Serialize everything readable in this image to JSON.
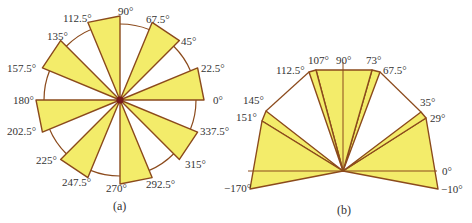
{
  "colors": {
    "fill": "#f3ec6a",
    "stroke": "#8b4a1c",
    "circle": "#8b4a1c",
    "center_dot": "#7a1a1a",
    "text": "#333333"
  },
  "figure_a": {
    "caption": "(a)",
    "center": [
      120,
      100
    ],
    "petal_radius": 84,
    "circle_radius": 76,
    "petals": [
      {
        "from": 0,
        "to": 22.5
      },
      {
        "from": 45,
        "to": 67.5
      },
      {
        "from": 90,
        "to": 112.5
      },
      {
        "from": 135,
        "to": 157.5
      },
      {
        "from": 180,
        "to": 202.5
      },
      {
        "from": 225,
        "to": 247.5
      },
      {
        "from": 270,
        "to": 292.5
      },
      {
        "from": 315,
        "to": 337.5
      }
    ],
    "labels": [
      {
        "text": "0°",
        "x": 213,
        "y": 104
      },
      {
        "text": "22.5°",
        "x": 201,
        "y": 72
      },
      {
        "text": "45°",
        "x": 181,
        "y": 45
      },
      {
        "text": "67.5°",
        "x": 146,
        "y": 23
      },
      {
        "text": "90°",
        "x": 118,
        "y": 15
      },
      {
        "text": "112.5°",
        "x": 63,
        "y": 22
      },
      {
        "text": "135°",
        "x": 47,
        "y": 40
      },
      {
        "text": "157.5°",
        "x": 7,
        "y": 72
      },
      {
        "text": "180°",
        "x": 13,
        "y": 104
      },
      {
        "text": "202.5°",
        "x": 7,
        "y": 135
      },
      {
        "text": "225°",
        "x": 36,
        "y": 164
      },
      {
        "text": "247.5°",
        "x": 62,
        "y": 186
      },
      {
        "text": "270°",
        "x": 106,
        "y": 192
      },
      {
        "text": "292.5°",
        "x": 146,
        "y": 188
      },
      {
        "text": "315°",
        "x": 185,
        "y": 168
      },
      {
        "text": "337.5°",
        "x": 200,
        "y": 135
      }
    ]
  },
  "figure_b": {
    "caption": "(b)",
    "center": [
      343,
      171
    ],
    "wedges": [
      {
        "name": "wedge-right-low",
        "points": [
          [
            343,
            171
          ],
          [
            438,
            189
          ],
          [
            426,
            118
          ]
        ]
      },
      {
        "name": "wedge-right-high",
        "points": [
          [
            343,
            171
          ],
          [
            421,
            112
          ],
          [
            426,
            118
          ]
        ]
      },
      {
        "name": "wedge-top-right",
        "points": [
          [
            343,
            171
          ],
          [
            380,
            72
          ],
          [
            372,
            70
          ]
        ]
      },
      {
        "name": "wedge-top-center",
        "points": [
          [
            343,
            171
          ],
          [
            316,
            70
          ],
          [
            372,
            70
          ]
        ]
      },
      {
        "name": "wedge-top-left",
        "points": [
          [
            343,
            171
          ],
          [
            309,
            72
          ],
          [
            316,
            70
          ]
        ]
      },
      {
        "name": "wedge-left-high",
        "points": [
          [
            343,
            171
          ],
          [
            266,
            111
          ],
          [
            262,
            121
          ]
        ]
      },
      {
        "name": "wedge-left-low",
        "points": [
          [
            343,
            171
          ],
          [
            262,
            121
          ],
          [
            250,
            189
          ]
        ]
      }
    ],
    "connector_lines": [
      {
        "from": [
          309,
          72
        ],
        "to": [
          266,
          111
        ]
      },
      {
        "from": [
          380,
          72
        ],
        "to": [
          421,
          112
        ]
      }
    ],
    "axis_horizontal": {
      "from": [
        248,
        171
      ],
      "to": [
        437,
        171
      ]
    },
    "axis_vertical": {
      "from": [
        343,
        171
      ],
      "to": [
        343,
        62
      ]
    },
    "labels": [
      {
        "text": "90°",
        "x": 336,
        "y": 64
      },
      {
        "text": "107°",
        "x": 308,
        "y": 64
      },
      {
        "text": "112.5°",
        "x": 276,
        "y": 74
      },
      {
        "text": "73°",
        "x": 366,
        "y": 64
      },
      {
        "text": "67.5°",
        "x": 383,
        "y": 74
      },
      {
        "text": "145°",
        "x": 243,
        "y": 104
      },
      {
        "text": "151°",
        "x": 236,
        "y": 121
      },
      {
        "text": "35°",
        "x": 420,
        "y": 106
      },
      {
        "text": "29°",
        "x": 430,
        "y": 122
      },
      {
        "text": "0°",
        "x": 442,
        "y": 175
      },
      {
        "text": "−170°",
        "x": 224,
        "y": 192
      },
      {
        "text": "−10°",
        "x": 441,
        "y": 193
      }
    ]
  }
}
